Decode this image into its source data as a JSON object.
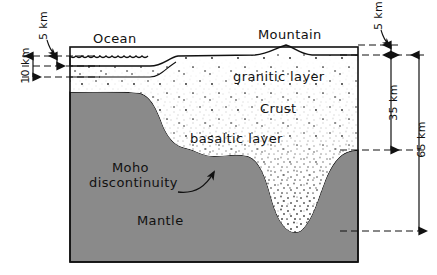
{
  "diagram": {
    "labels": {
      "ocean": "Ocean",
      "mountain": "Mountain",
      "granitic_layer": "granitic layer",
      "crust": "Crust",
      "basaltic_layer": "basaltic layer",
      "moho_line1": "Moho",
      "moho_line2": "discontinuity",
      "mantle": "Mantle"
    },
    "scale_left": {
      "ocean_depth": "5 km",
      "oceanic_crust_total": "10 km"
    },
    "scale_right": {
      "mountain_height": "5 km",
      "continental_crust": "35 km",
      "root_depth": "65 km"
    },
    "colors": {
      "mantle": "#8a8a8a",
      "crust": "#ffffff",
      "ink": "#111111",
      "background": "#ffffff"
    }
  }
}
